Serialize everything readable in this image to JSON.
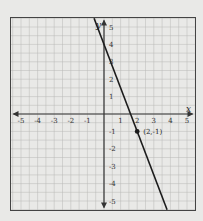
{
  "chart_data": {
    "type": "line",
    "title": "",
    "xlabel": "x",
    "ylabel": "y",
    "xlim": [
      -5.5,
      5.5
    ],
    "ylim": [
      -5.5,
      5.5
    ],
    "grid": true,
    "grid_minor_step": 0.5,
    "x_ticks": [
      "-5",
      "-4",
      "-3",
      "-2",
      "-1",
      "1",
      "2",
      "3",
      "4",
      "5"
    ],
    "y_ticks": [
      "5",
      "4",
      "3",
      "2",
      "1",
      "-1",
      "-2",
      "-3",
      "-4",
      "-5"
    ],
    "series": [
      {
        "name": "line",
        "equation_estimate": "y = -2.5x + 4",
        "points": [
          {
            "x": -0.6,
            "y": 5.5
          },
          {
            "x": 3.8,
            "y": -5.5
          }
        ]
      }
    ],
    "annotations": [
      {
        "type": "point",
        "x": 2,
        "y": -1,
        "label": "(2,-1)"
      }
    ],
    "colors": {
      "background": "#e9e9e7",
      "grid": "#b9b9b7",
      "axis": "#333333",
      "line": "#1c1c1c"
    }
  }
}
